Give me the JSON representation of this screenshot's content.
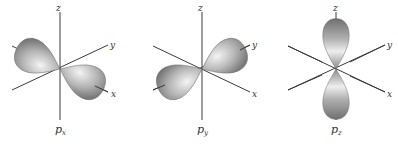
{
  "figure": {
    "panels": [
      {
        "id": "px",
        "caption": "p",
        "subscript": "x",
        "axis_labels": {
          "x": "x",
          "y": "y",
          "z": "z"
        }
      },
      {
        "id": "py",
        "caption": "p",
        "subscript": "y",
        "axis_labels": {
          "x": "x",
          "y": "y",
          "z": "z"
        }
      },
      {
        "id": "pz",
        "caption": "p",
        "subscript": "z",
        "axis_labels": {
          "x": "x",
          "y": "y",
          "z": "z"
        }
      }
    ],
    "colors": {
      "lobe_light": "#f2f2f2",
      "lobe_mid": "#b8b8b8",
      "lobe_dark": "#7a7a7a",
      "axis": "#3a3a3a"
    }
  }
}
